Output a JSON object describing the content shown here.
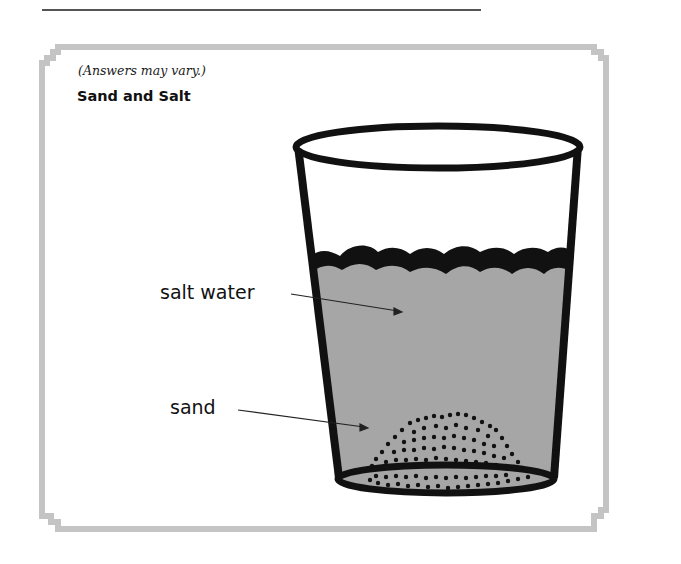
{
  "page": {
    "note": "(Answers may vary.)",
    "title": "Sand and Salt"
  },
  "diagram": {
    "labels": [
      {
        "id": "salt-water",
        "text": "salt water"
      },
      {
        "id": "sand",
        "text": "sand"
      }
    ],
    "colors": {
      "frame_border": "#c4c4c4",
      "water": "#a6a6a6",
      "outline": "#111111",
      "top_rule": "#555555"
    }
  }
}
